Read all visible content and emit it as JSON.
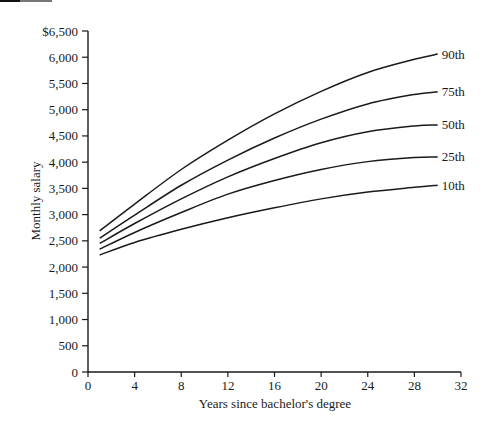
{
  "chart_data": {
    "type": "line",
    "title": "",
    "xlabel": "Years since bachelor's degree",
    "ylabel": "Monthly salary",
    "xlim": [
      0,
      32
    ],
    "ylim": [
      0,
      6500
    ],
    "grid": false,
    "legend": "inline labels at right end of each line",
    "x_ticks": [
      0,
      4,
      8,
      12,
      16,
      20,
      24,
      28,
      32
    ],
    "x_tick_labels": [
      "0",
      "4",
      "8",
      "12",
      "16",
      "20",
      "24",
      "28",
      "32"
    ],
    "y_ticks": [
      0,
      500,
      1000,
      1500,
      2000,
      2500,
      3000,
      3500,
      4000,
      4500,
      5000,
      5500,
      6000,
      6500
    ],
    "y_tick_labels": [
      "0",
      "500",
      "1,000",
      "1,500",
      "2,000",
      "2,500",
      "3,000",
      "3,500",
      "4,000",
      "4,500",
      "5,000",
      "5,500",
      "6,000",
      "$6,500"
    ],
    "x": [
      1,
      4,
      8,
      12,
      16,
      20,
      24,
      28,
      30
    ],
    "series": [
      {
        "name": "90th",
        "values": [
          2690,
          3200,
          3860,
          4420,
          4920,
          5350,
          5710,
          5960,
          6060
        ]
      },
      {
        "name": "75th",
        "values": [
          2550,
          2990,
          3560,
          4040,
          4460,
          4820,
          5110,
          5290,
          5340
        ]
      },
      {
        "name": "50th",
        "values": [
          2450,
          2830,
          3300,
          3720,
          4070,
          4370,
          4580,
          4690,
          4710
        ]
      },
      {
        "name": "25th",
        "values": [
          2340,
          2660,
          3040,
          3390,
          3650,
          3860,
          4010,
          4090,
          4100
        ]
      },
      {
        "name": "10th",
        "values": [
          2230,
          2470,
          2720,
          2940,
          3130,
          3300,
          3430,
          3520,
          3560
        ]
      }
    ]
  },
  "colors": {
    "line": "#1a1a1a",
    "axis": "#1a1a1a",
    "background": "#ffffff"
  }
}
